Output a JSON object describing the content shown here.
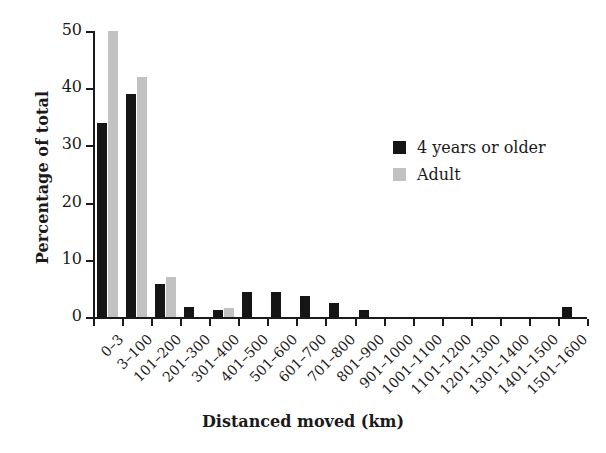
{
  "chart_data": {
    "type": "bar",
    "title": "",
    "xlabel": "Distanced moved (km)",
    "ylabel": "Percentage of total",
    "ylim": [
      0,
      50
    ],
    "yticks": [
      0,
      10,
      20,
      30,
      40,
      50
    ],
    "grid": false,
    "legend_position": "inside-upper-right",
    "categories": [
      "0–3",
      "3–100",
      "101–200",
      "201–300",
      "301–400",
      "401–500",
      "501–600",
      "601–700",
      "701–800",
      "801–900",
      "901–1000",
      "1001–1100",
      "1101–1200",
      "1201–1300",
      "1301–1400",
      "1401–1500",
      "1501–1600"
    ],
    "series": [
      {
        "name": "4 years or older",
        "color": "#151515",
        "values": [
          34,
          39,
          5.7,
          1.7,
          1.2,
          4.3,
          4.3,
          3.6,
          2.4,
          1.2,
          0,
          0,
          0,
          0,
          0,
          0,
          1.7
        ]
      },
      {
        "name": "Adult",
        "color": "#c2c2c2",
        "values": [
          50,
          42,
          7.0,
          0,
          1.6,
          0,
          0,
          0,
          0,
          0,
          0,
          0,
          0,
          0,
          0,
          0,
          0
        ]
      }
    ]
  },
  "axes": {
    "y_title": "Percentage of total",
    "x_title": "Distanced moved (km)"
  },
  "legend": {
    "items": [
      {
        "label": "4 years or older",
        "color": "#151515"
      },
      {
        "label": "Adult",
        "color": "#c2c2c2"
      }
    ]
  }
}
